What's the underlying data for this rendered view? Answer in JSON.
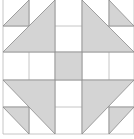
{
  "diagram": {
    "type": "quilt-block",
    "colors": {
      "background": "#ffffff",
      "shade": "#d4d4d4",
      "stroke": "#8a8a8a",
      "grid": "#b8b8b8"
    },
    "grid_x": [
      3,
      29,
      55,
      82,
      109,
      134
    ],
    "grid_y": [
      0,
      26,
      52,
      80,
      107,
      134
    ],
    "shapes": [
      {
        "name": "top-left-small-triangle",
        "points": "3,26 29,0 29,26"
      },
      {
        "name": "top-left-large-triangle",
        "points": "3,52 55,0 55,52"
      },
      {
        "name": "top-right-large-triangle",
        "points": "82,0 134,52 82,52"
      },
      {
        "name": "top-right-small-triangle",
        "points": "109,0 134,26 109,26"
      },
      {
        "name": "center-square",
        "points": "55,52 82,52 82,80 55,80"
      },
      {
        "name": "bottom-left-large-triangle",
        "points": "3,80 55,80 55,134"
      },
      {
        "name": "bottom-left-small-triangle",
        "points": "3,107 29,107 29,134"
      },
      {
        "name": "bottom-right-large-triangle",
        "points": "82,80 134,80 82,134"
      },
      {
        "name": "bottom-right-small-triangle",
        "points": "109,107 134,107 109,134"
      }
    ]
  }
}
